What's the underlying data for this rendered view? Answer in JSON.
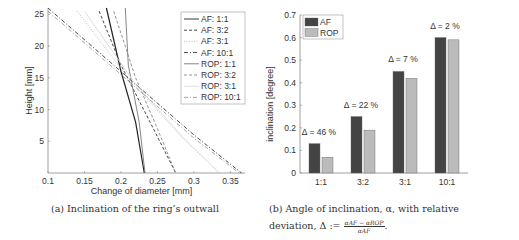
{
  "chart_data": [
    {
      "type": "line",
      "title": "",
      "xlabel": "Change of diameter [mm]",
      "ylabel": "Height [mm]",
      "xlim": [
        0.1,
        0.37
      ],
      "ylim": [
        0,
        26
      ],
      "xticks": [
        "0.1",
        "0.15",
        "0.2",
        "0.25",
        "0.3",
        "0.35"
      ],
      "yticks": [
        "5",
        "10",
        "15",
        "20",
        "25"
      ],
      "grid": false,
      "legend_position": "upper right",
      "series": [
        {
          "name": "AF: 1:1",
          "style": "solid",
          "color": "#222222",
          "points": [
            [
              0.18,
              26
            ],
            [
              0.2,
              16
            ],
            [
              0.22,
              8
            ],
            [
              0.232,
              0
            ]
          ]
        },
        {
          "name": "AF: 3:2",
          "style": "dashed",
          "color": "#333333",
          "points": [
            [
              0.17,
              25.5
            ],
            [
              0.2,
              17
            ],
            [
              0.24,
              8
            ],
            [
              0.275,
              0
            ]
          ]
        },
        {
          "name": "AF: 3:1",
          "style": "dotted",
          "color": "#bbbbbb",
          "points": [
            [
              0.14,
              25.5
            ],
            [
              0.21,
              15
            ],
            [
              0.28,
              6
            ],
            [
              0.335,
              0
            ]
          ]
        },
        {
          "name": "AF: 10:1",
          "style": "dashdot",
          "color": "#333333",
          "points": [
            [
              0.1,
              26
            ],
            [
              0.2,
              16
            ],
            [
              0.3,
              6
            ],
            [
              0.365,
              0
            ]
          ]
        },
        {
          "name": "ROP: 1:1",
          "style": "solid",
          "color": "#777777",
          "points": [
            [
              0.206,
              26
            ],
            [
              0.21,
              17
            ],
            [
              0.225,
              8
            ],
            [
              0.233,
              0
            ]
          ]
        },
        {
          "name": "ROP: 3:2",
          "style": "dashed",
          "color": "#888888",
          "points": [
            [
              0.19,
              25.5
            ],
            [
              0.22,
              15
            ],
            [
              0.25,
              7
            ],
            [
              0.275,
              0
            ]
          ]
        },
        {
          "name": "ROP: 3:1",
          "style": "solid",
          "color": "#dddddd",
          "points": [
            [
              0.15,
              25.5
            ],
            [
              0.22,
              14
            ],
            [
              0.29,
              5
            ],
            [
              0.335,
              0
            ]
          ]
        },
        {
          "name": "ROP: 10:1",
          "style": "dashdot",
          "color": "#999999",
          "points": [
            [
              0.1,
              25.5
            ],
            [
              0.2,
              15.5
            ],
            [
              0.3,
              5.5
            ],
            [
              0.362,
              0
            ]
          ]
        }
      ]
    },
    {
      "type": "bar",
      "title": "",
      "xlabel": "",
      "ylabel": "inclination [degree]",
      "ylim": [
        0,
        0.7
      ],
      "yticks": [
        "0",
        "0.1",
        "0.2",
        "0.3",
        "0.4",
        "0.5",
        "0.6",
        "0.7"
      ],
      "categories": [
        "1:1",
        "3:2",
        "3:1",
        "10:1"
      ],
      "series": [
        {
          "name": "AF",
          "color": "#444444",
          "values": [
            0.13,
            0.25,
            0.45,
            0.6
          ]
        },
        {
          "name": "ROP",
          "color": "#bbbbbb",
          "values": [
            0.07,
            0.19,
            0.42,
            0.59
          ]
        }
      ],
      "annotations": [
        "Δ = 46 %",
        "Δ = 22 %",
        "Δ = 7 %",
        "Δ = 2 %"
      ],
      "legend_position": "upper left"
    }
  ],
  "captions": {
    "a": "(a) Inclination of the ring’s outwall",
    "b_line1": "(b) Angle of inclination, α, with relative",
    "b_line2": "deviation, Δ :=",
    "b_num": "αₐₓ − αᵣₒₚ",
    "b_num_text": "αAF − αROP",
    "b_den_text": "αAF"
  }
}
